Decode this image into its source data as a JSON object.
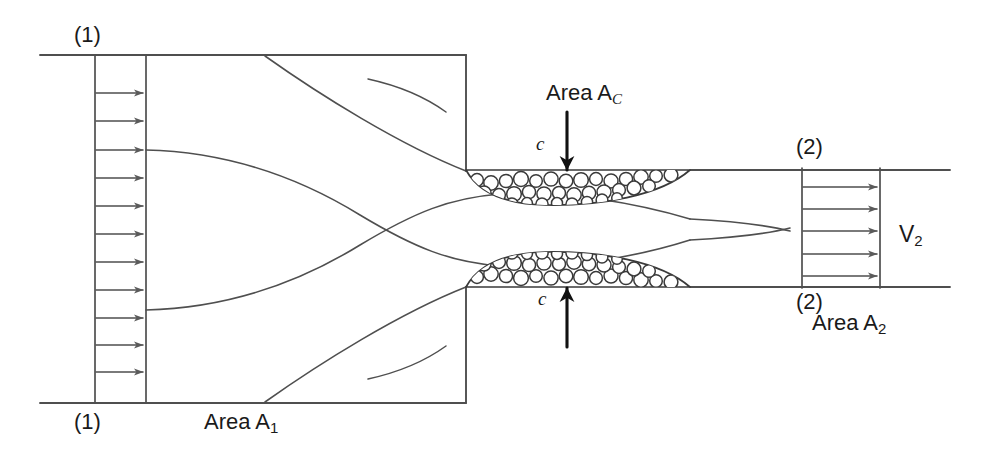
{
  "diagram": {
    "type": "fluid-mechanics-schematic",
    "line_color": "#4f4f4f",
    "ink_color": "#1a1a1a",
    "background": "#ffffff",
    "width": 990,
    "height": 457
  },
  "labels": {
    "section1_top": "(1)",
    "section1_bottom": "(1)",
    "section2_top": "(2)",
    "section2_bottom": "(2)",
    "area1": "Area A",
    "area1_sub": "1",
    "area_c": "Area A",
    "area_c_sub": "C",
    "area2": "Area A",
    "area2_sub": "2",
    "velocity2": "V",
    "velocity2_sub": "2",
    "contraction_upper": "c",
    "contraction_lower": "c"
  },
  "annotations": {
    "arrow_down_name": "area-c-pointer-down",
    "arrow_up_name": "area-c-pointer-up"
  },
  "profiles": {
    "inlet": {
      "label": "uniform inlet velocity profile",
      "arrow_count": 11,
      "box_left": 95,
      "box_right": 146,
      "box_top": 55,
      "box_bottom": 403
    },
    "outlet": {
      "label": "uniform outlet velocity profile",
      "arrow_count": 5,
      "box_left": 802,
      "box_right": 880,
      "box_top": 168,
      "box_bottom": 288
    }
  },
  "regions": {
    "upper_eddy": "separation bubble upper",
    "lower_eddy": "separation bubble lower"
  }
}
